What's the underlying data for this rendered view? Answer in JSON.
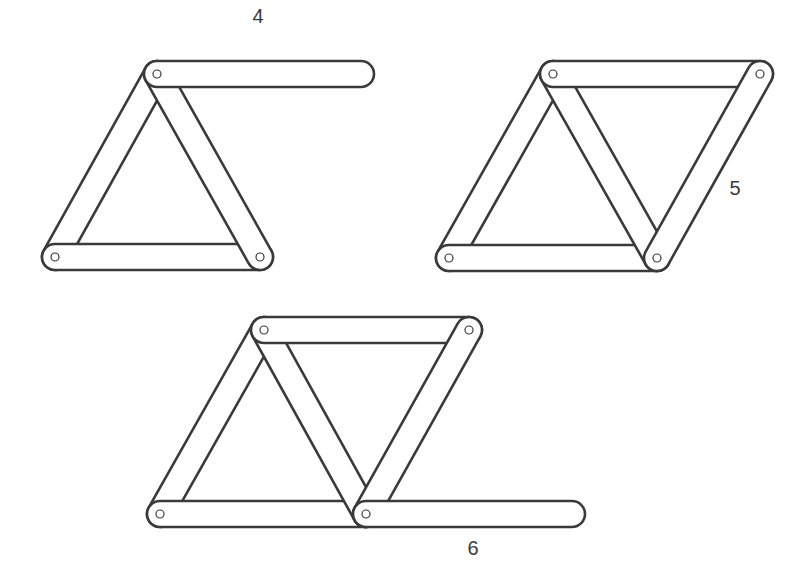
{
  "style": {
    "stroke_color": "#3a3a3a",
    "fill_color": "#ffffff",
    "bar_width": 26,
    "outline_width": 2.6,
    "pin_radius": 4
  },
  "figures": [
    {
      "id": "figure-4",
      "label": "4",
      "label_pos": [
        258,
        23
      ],
      "bars": [
        {
          "from": [
            157,
            74
          ],
          "to": [
            55,
            257
          ],
          "pins": [
            [
              157,
              74
            ],
            [
              55,
              257
            ]
          ]
        },
        {
          "from": [
            55,
            257
          ],
          "to": [
            260,
            257
          ],
          "pins": [
            [
              55,
              257
            ]
          ]
        },
        {
          "from": [
            157,
            74
          ],
          "to": [
            260,
            257
          ],
          "pins": [
            [
              260,
              257
            ]
          ]
        },
        {
          "from": [
            157,
            74
          ],
          "to": [
            361,
            74
          ],
          "pins": [
            [
              157,
              74
            ]
          ]
        }
      ]
    },
    {
      "id": "figure-5",
      "label": "5",
      "label_pos": [
        735,
        195
      ],
      "bars": [
        {
          "from": [
            553,
            74
          ],
          "to": [
            449,
            258
          ],
          "pins": []
        },
        {
          "from": [
            449,
            258
          ],
          "to": [
            657,
            258
          ],
          "pins": [
            [
              449,
              258
            ]
          ]
        },
        {
          "from": [
            553,
            74
          ],
          "to": [
            657,
            258
          ],
          "pins": []
        },
        {
          "from": [
            553,
            74
          ],
          "to": [
            760,
            74
          ],
          "pins": [
            [
              553,
              74
            ]
          ]
        },
        {
          "from": [
            760,
            74
          ],
          "to": [
            657,
            258
          ],
          "pins": [
            [
              760,
              74
            ],
            [
              657,
              258
            ]
          ]
        }
      ]
    },
    {
      "id": "figure-6",
      "label": "6",
      "label_pos": [
        473,
        555
      ],
      "bars": [
        {
          "from": [
            264,
            330
          ],
          "to": [
            160,
            514
          ],
          "pins": []
        },
        {
          "from": [
            160,
            514
          ],
          "to": [
            366,
            514
          ],
          "pins": [
            [
              160,
              514
            ]
          ]
        },
        {
          "from": [
            264,
            330
          ],
          "to": [
            366,
            514
          ],
          "pins": []
        },
        {
          "from": [
            264,
            330
          ],
          "to": [
            469,
            330
          ],
          "pins": [
            [
              264,
              330
            ]
          ]
        },
        {
          "from": [
            469,
            330
          ],
          "to": [
            366,
            514
          ],
          "pins": [
            [
              469,
              330
            ]
          ]
        },
        {
          "from": [
            366,
            514
          ],
          "to": [
            572,
            514
          ],
          "pins": [
            [
              366,
              514
            ]
          ]
        }
      ]
    }
  ]
}
